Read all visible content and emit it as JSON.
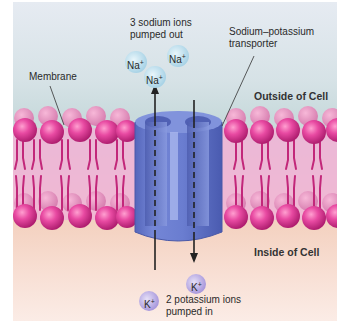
{
  "diagram": {
    "labels": {
      "sodium_out_line1": "3 sodium ions",
      "sodium_out_line2": "pumped out",
      "transporter_line1": "Sodium–potassium",
      "transporter_line2": "transporter",
      "membrane": "Membrane",
      "outside": "Outside of Cell",
      "inside": "Inside of Cell",
      "potassium_in_line1": "2 potassium ions",
      "potassium_in_line2": "pumped in"
    },
    "ions": {
      "sodium": [
        {
          "symbol": "Na",
          "charge": "+"
        },
        {
          "symbol": "Na",
          "charge": "+"
        },
        {
          "symbol": "Na",
          "charge": "+"
        }
      ],
      "potassium": [
        {
          "symbol": "K",
          "charge": "+"
        },
        {
          "symbol": "K",
          "charge": "+"
        }
      ]
    },
    "arrows": [
      {
        "name": "sodium-out-arrow",
        "direction": "up"
      },
      {
        "name": "potassium-in-arrow",
        "direction": "down"
      }
    ],
    "colors": {
      "outside_bg": "#c8dadc",
      "inside_bg": "#f4d2c1",
      "phospholipid_head": "#e0409a",
      "phospholipid_tail": "#c2277a",
      "transporter": "#6b7fd0",
      "sodium_ion": "#bfe0ef",
      "potassium_ion": "#c6b8e8"
    }
  }
}
